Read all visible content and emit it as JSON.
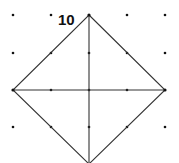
{
  "figure": {
    "label": "10",
    "colors": {
      "line": "#333333",
      "dot": "#111111",
      "label": "#111111",
      "background": "#ffffff"
    },
    "grid_x": [
      13,
      51,
      89,
      127,
      165
    ],
    "grid_y": [
      15,
      53,
      90,
      127,
      164
    ],
    "shape": "square rotated 45° (diamond) on dot grid with both diagonals",
    "vertices": {
      "top": [
        89,
        15
      ],
      "right": [
        165,
        90
      ],
      "bottom": [
        89,
        164
      ],
      "left": [
        13,
        90
      ]
    }
  }
}
